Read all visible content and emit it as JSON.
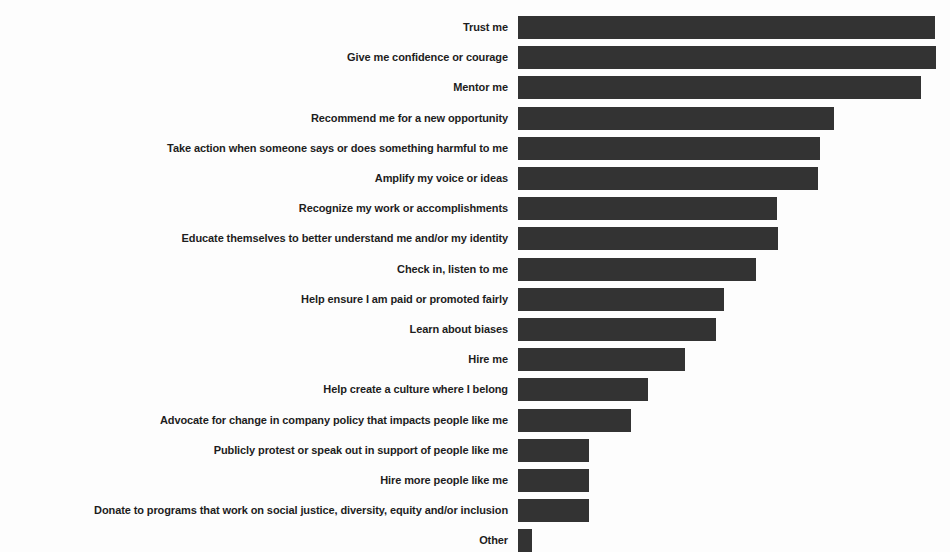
{
  "chart_data": {
    "type": "bar",
    "orientation": "horizontal",
    "title": "",
    "subtitle": "",
    "xlabel": "",
    "ylabel": "",
    "grid": false,
    "legend": false,
    "axis_visible": false,
    "tick_labels_visible": false,
    "bar_color": "#333333",
    "background_color": "#fdfdfd",
    "label_color": "#1d1d1d",
    "xlim": [
      0,
      440
    ],
    "categories": [
      "Trust me",
      "Give me confidence or courage",
      "Mentor me",
      "Recommend me for a new opportunity",
      "Take action when someone says or does something harmful to me",
      "Amplify my voice or ideas",
      "Recognize my work or accomplishments",
      "Educate themselves to better understand me and/or my identity",
      "Check in, listen to me",
      "Help ensure I am paid or promoted fairly",
      "Learn about biases",
      "Hire me",
      "Help create a culture where I belong",
      "Advocate for change in company policy that impacts people like me",
      "Publicly protest or speak out in support of people like me",
      "Hire more people like me",
      "Donate to programs that work on social justice, diversity, equity and/or inclusion",
      "Other"
    ],
    "values": [
      425,
      426,
      410,
      322,
      308,
      306,
      264,
      265,
      242,
      210,
      202,
      170,
      132,
      115,
      72,
      72,
      72,
      14
    ]
  }
}
